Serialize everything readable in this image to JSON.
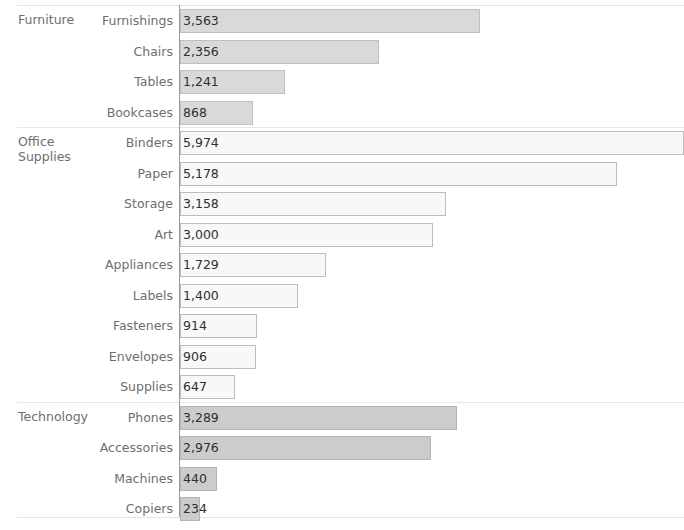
{
  "chart_data": {
    "type": "bar",
    "orientation": "horizontal",
    "title": "",
    "xlabel": "",
    "ylabel": "",
    "xlim": [
      0,
      5974
    ],
    "grid": false,
    "legend": "none",
    "value_format": "comma-separated integer",
    "axis_zero_at": 0,
    "groups": [
      {
        "name": "Furniture",
        "color": "#d9d9d9",
        "categories": [
          "Furnishings",
          "Chairs",
          "Tables",
          "Bookcases"
        ],
        "values": [
          3563,
          2356,
          1241,
          868
        ],
        "labels": [
          "3,563",
          "2,356",
          "1,241",
          "868"
        ]
      },
      {
        "name": "Office Supplies",
        "color": "#f8f8f8",
        "categories": [
          "Binders",
          "Paper",
          "Storage",
          "Art",
          "Appliances",
          "Labels",
          "Fasteners",
          "Envelopes",
          "Supplies"
        ],
        "values": [
          5974,
          5178,
          3158,
          3000,
          1729,
          1400,
          914,
          906,
          647
        ],
        "labels": [
          "5,974",
          "5,178",
          "3,158",
          "3,000",
          "1,729",
          "1,400",
          "914",
          "906",
          "647"
        ]
      },
      {
        "name": "Technology",
        "color": "#cccccc",
        "categories": [
          "Phones",
          "Accessories",
          "Machines",
          "Copiers"
        ],
        "values": [
          3289,
          2976,
          440,
          234
        ],
        "labels": [
          "3,289",
          "2,976",
          "440",
          "234"
        ]
      }
    ]
  },
  "rows": [
    {
      "group": "Furniture",
      "group_first": true,
      "category": "Furnishings",
      "value": 3563,
      "label": "3,563",
      "fill": "fill-furniture"
    },
    {
      "group": "Furniture",
      "group_first": false,
      "category": "Chairs",
      "value": 2356,
      "label": "2,356",
      "fill": "fill-furniture"
    },
    {
      "group": "Furniture",
      "group_first": false,
      "category": "Tables",
      "value": 1241,
      "label": "1,241",
      "fill": "fill-furniture"
    },
    {
      "group": "Furniture",
      "group_first": false,
      "category": "Bookcases",
      "value": 868,
      "label": "868",
      "fill": "fill-furniture"
    },
    {
      "group": "Office Supplies",
      "group_first": true,
      "category": "Binders",
      "value": 5974,
      "label": "5,974",
      "fill": "fill-office"
    },
    {
      "group": "Office Supplies",
      "group_first": false,
      "category": "Paper",
      "value": 5178,
      "label": "5,178",
      "fill": "fill-office"
    },
    {
      "group": "Office Supplies",
      "group_first": false,
      "category": "Storage",
      "value": 3158,
      "label": "3,158",
      "fill": "fill-office"
    },
    {
      "group": "Office Supplies",
      "group_first": false,
      "category": "Art",
      "value": 3000,
      "label": "3,000",
      "fill": "fill-office"
    },
    {
      "group": "Office Supplies",
      "group_first": false,
      "category": "Appliances",
      "value": 1729,
      "label": "1,729",
      "fill": "fill-office"
    },
    {
      "group": "Office Supplies",
      "group_first": false,
      "category": "Labels",
      "value": 1400,
      "label": "1,400",
      "fill": "fill-office"
    },
    {
      "group": "Office Supplies",
      "group_first": false,
      "category": "Fasteners",
      "value": 914,
      "label": "914",
      "fill": "fill-office"
    },
    {
      "group": "Office Supplies",
      "group_first": false,
      "category": "Envelopes",
      "value": 906,
      "label": "906",
      "fill": "fill-office"
    },
    {
      "group": "Office Supplies",
      "group_first": false,
      "category": "Supplies",
      "value": 647,
      "label": "647",
      "fill": "fill-office"
    },
    {
      "group": "Technology",
      "group_first": true,
      "category": "Phones",
      "value": 3289,
      "label": "3,289",
      "fill": "fill-technology"
    },
    {
      "group": "Technology",
      "group_first": false,
      "category": "Accessories",
      "value": 2976,
      "label": "2,976",
      "fill": "fill-technology"
    },
    {
      "group": "Technology",
      "group_first": false,
      "category": "Machines",
      "value": 440,
      "label": "440",
      "fill": "fill-technology"
    },
    {
      "group": "Technology",
      "group_first": false,
      "category": "Copiers",
      "value": 234,
      "label": "234",
      "fill": "fill-technology"
    }
  ],
  "group_labels": [
    {
      "name": "Furniture",
      "display": "Furniture"
    },
    {
      "name": "Office Supplies",
      "display": "Office\nSupplies"
    },
    {
      "name": "Technology",
      "display": "Technology"
    }
  ],
  "layout": {
    "row_height": 30.5,
    "first_row_top": 6,
    "axis_x": 180,
    "px_per_unit": 0.0843,
    "bar_height": 24
  }
}
